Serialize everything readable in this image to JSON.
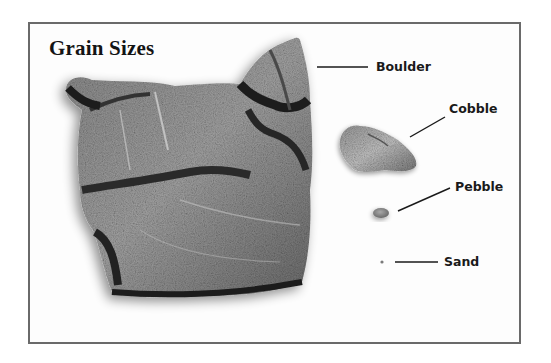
{
  "figure": {
    "title": "Grain Sizes",
    "specimens": [
      {
        "id": "boulder",
        "label": "Boulder",
        "relative_size": "largest"
      },
      {
        "id": "cobble",
        "label": "Cobble",
        "relative_size": "medium"
      },
      {
        "id": "pebble",
        "label": "Pebble",
        "relative_size": "small"
      },
      {
        "id": "sand",
        "label": "Sand",
        "relative_size": "smallest"
      }
    ],
    "colors": {
      "frame_border": "#6a6a6a",
      "background": "#ffffff",
      "text": "#1a1a1a",
      "rock_dark": "#2a2a2a",
      "rock_mid": "#6e6e6e",
      "rock_light": "#b5b5b5"
    }
  }
}
